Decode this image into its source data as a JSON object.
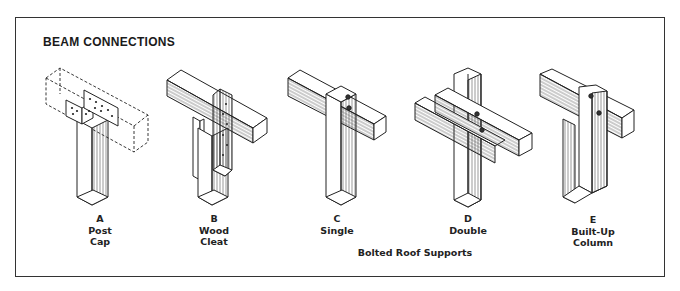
{
  "figure": {
    "title": "BEAM CONNECTIONS",
    "group_label": "Bolted Roof Supports",
    "items": [
      {
        "letter": "A",
        "line1": "Post",
        "line2": "Cap"
      },
      {
        "letter": "B",
        "line1": "Wood",
        "line2": "Cleat"
      },
      {
        "letter": "C",
        "line1": "Single",
        "line2": ""
      },
      {
        "letter": "D",
        "line1": "Double",
        "line2": ""
      },
      {
        "letter": "E",
        "line1": "Built-Up",
        "line2": "Column"
      }
    ]
  },
  "colors": {
    "line": "#222222",
    "background": "#ffffff"
  }
}
